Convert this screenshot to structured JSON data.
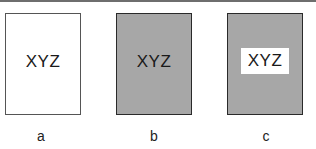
{
  "panels": [
    {
      "id": "a",
      "text": "XYZ",
      "background": "white",
      "text_highlight": false,
      "caption": "a"
    },
    {
      "id": "b",
      "text": "XYZ",
      "background": "gray",
      "text_highlight": false,
      "caption": "b"
    },
    {
      "id": "c",
      "text": "XYZ",
      "background": "gray",
      "text_highlight": true,
      "caption": "c"
    }
  ],
  "colors": {
    "panel_gray": "#a7a7a7",
    "panel_white": "#ffffff",
    "border": "#2a2a2a",
    "text": "#1a1a1a"
  }
}
